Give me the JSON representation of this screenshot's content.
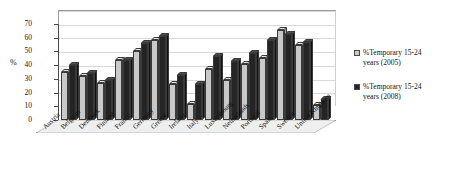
{
  "chart_data": {
    "type": "bar",
    "title": "",
    "xlabel": "",
    "ylabel": "%",
    "ylim": [
      0,
      70
    ],
    "yticks": [
      0,
      10,
      20,
      30,
      40,
      50,
      60,
      70
    ],
    "grid": true,
    "legend_position": "right",
    "style": "3d-clustered-column",
    "categories": [
      "Austria",
      "Belgium",
      "Denmark",
      "Finland",
      "France",
      "Germany",
      "Greece",
      "Ireland",
      "Italy",
      "Luxembourg",
      "Netherlands",
      "Portugal",
      "Spain",
      "Sweden",
      "United Kingdom"
    ],
    "series": [
      {
        "name": "%Temporary 15-24 years (2005)",
        "color": "#c9c9c9",
        "values": [
          35,
          32,
          27,
          44,
          50,
          58,
          26,
          12,
          37,
          29,
          41,
          45,
          66,
          55,
          11
        ]
      },
      {
        "name": "%Temporary 15-24 years (2008)",
        "color": "#242424",
        "values": [
          40,
          34,
          29,
          44,
          56,
          61,
          33,
          26,
          47,
          43,
          49,
          58,
          63,
          57,
          15
        ]
      }
    ]
  },
  "legend": {
    "entries": [
      {
        "label_line1": "%Temporary 15-24",
        "label_line2": "years (2005)"
      },
      {
        "label_line1": "%Temporary 15-24",
        "label_line2": "years (2008)"
      }
    ]
  },
  "axis": {
    "y_title": "%"
  }
}
